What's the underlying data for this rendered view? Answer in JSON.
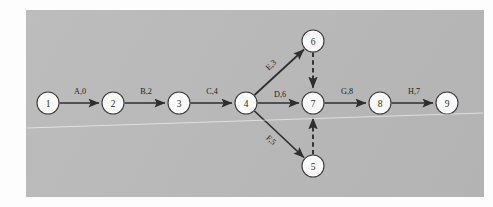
{
  "figure": {
    "kind": "activity-on-arrow network diagram",
    "background_color": "#b9b9b9",
    "page_color": "#fdfdfd",
    "node_fill": "#fbfbfb",
    "node_stroke": "#3a3a3a",
    "edge_color": "#2e2e2e"
  },
  "nodes": [
    {
      "id": "1",
      "label": "1",
      "cx": 48,
      "cy": 103,
      "r": 11
    },
    {
      "id": "2",
      "label": "2",
      "cx": 113,
      "cy": 103,
      "r": 11
    },
    {
      "id": "3",
      "label": "3",
      "cx": 179,
      "cy": 103,
      "r": 11
    },
    {
      "id": "4",
      "label": "4",
      "cx": 246,
      "cy": 103,
      "r": 11
    },
    {
      "id": "5",
      "label": "5",
      "cx": 313,
      "cy": 166,
      "r": 11
    },
    {
      "id": "6",
      "label": "6",
      "cx": 313,
      "cy": 41,
      "r": 11
    },
    {
      "id": "7",
      "label": "7",
      "cx": 313,
      "cy": 103,
      "r": 11
    },
    {
      "id": "8",
      "label": "8",
      "cx": 380,
      "cy": 103,
      "r": 11
    },
    {
      "id": "9",
      "label": "9",
      "cx": 447,
      "cy": 103,
      "r": 11
    }
  ],
  "edges": [
    {
      "from": "1",
      "to": "2",
      "label": "A,0",
      "style": "solid",
      "label_x": 80,
      "label_y": 91,
      "rotate": 0
    },
    {
      "from": "2",
      "to": "3",
      "label": "B,2",
      "style": "solid",
      "label_x": 146,
      "label_y": 91,
      "rotate": 0
    },
    {
      "from": "3",
      "to": "4",
      "label": "C,4",
      "style": "solid",
      "label_x": 212,
      "label_y": 91,
      "rotate": 0
    },
    {
      "from": "4",
      "to": "7",
      "label": "D,6",
      "style": "solid",
      "label_x": 280,
      "label_y": 94,
      "rotate": 0
    },
    {
      "from": "4",
      "to": "6",
      "label": "E,3",
      "style": "solid",
      "label_x": 271,
      "label_y": 65,
      "rotate": -43
    },
    {
      "from": "4",
      "to": "5",
      "label": "F,5",
      "style": "solid",
      "label_x": 271,
      "label_y": 140,
      "rotate": 43
    },
    {
      "from": "7",
      "to": "8",
      "label": "G,8",
      "style": "solid",
      "label_x": 347,
      "label_y": 91,
      "rotate": 0
    },
    {
      "from": "8",
      "to": "9",
      "label": "H,7",
      "style": "solid",
      "label_x": 414,
      "label_y": 91,
      "rotate": 0
    },
    {
      "from": "6",
      "to": "7",
      "label": "",
      "style": "dashed",
      "label_x": 0,
      "label_y": 0,
      "rotate": 0
    },
    {
      "from": "5",
      "to": "7",
      "label": "",
      "style": "dashed",
      "label_x": 0,
      "label_y": 0,
      "rotate": 0
    }
  ],
  "artifacts": {
    "scanline_label": "scan-artifact-line"
  }
}
